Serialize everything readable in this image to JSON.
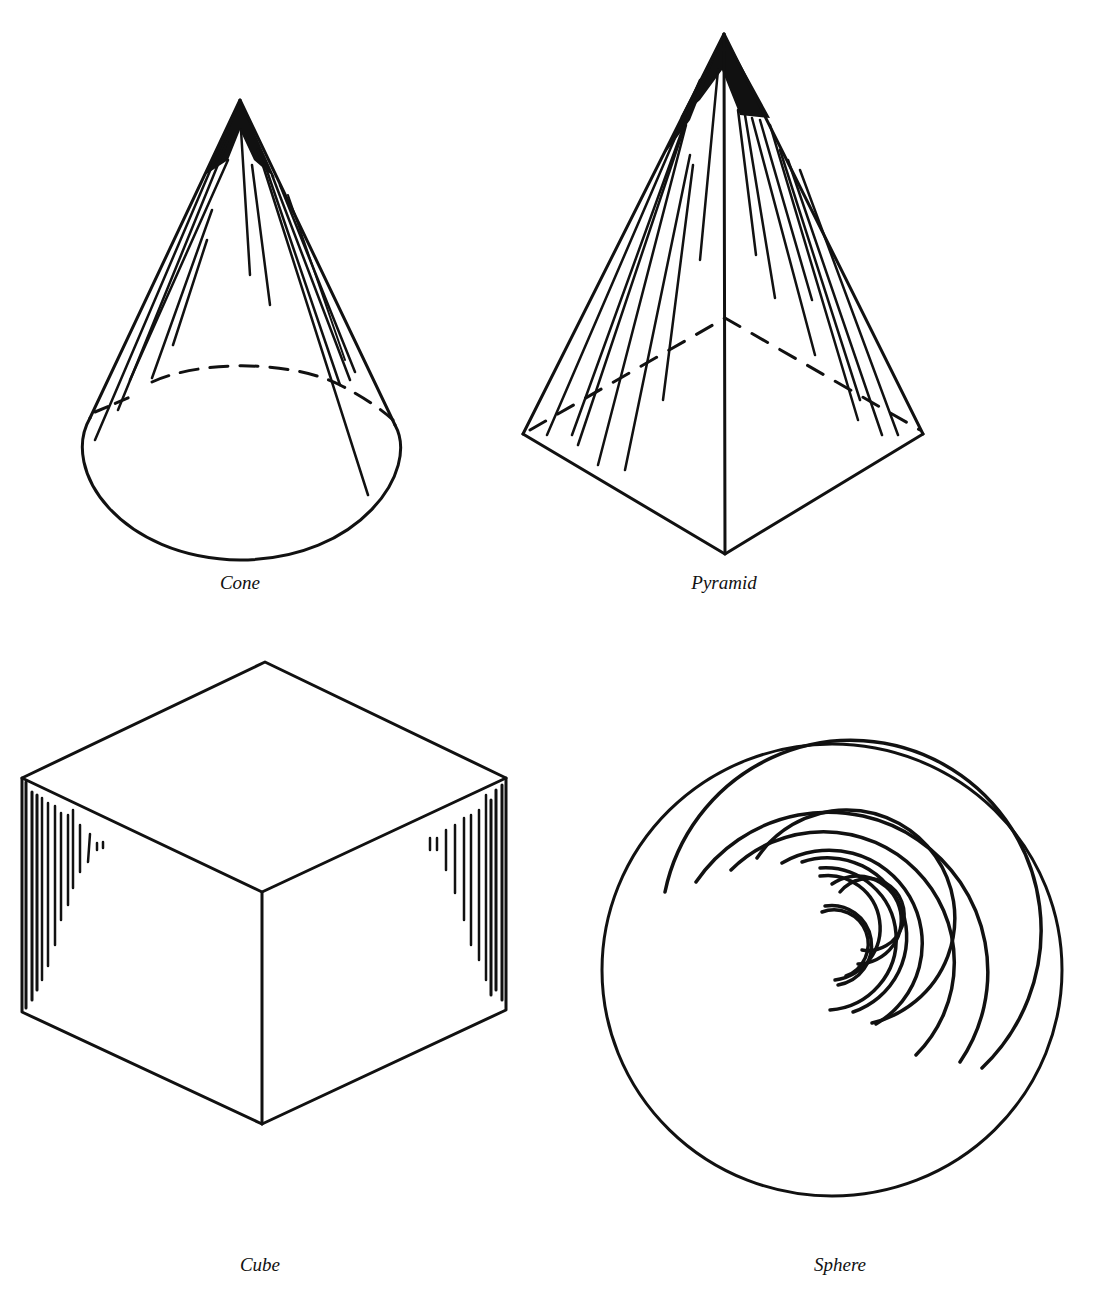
{
  "figure": {
    "stroke_color": "#111111",
    "background": "#ffffff"
  },
  "shapes": [
    {
      "id": "cone",
      "label": "Cone",
      "caption_x": 240,
      "caption_y": 570
    },
    {
      "id": "pyramid",
      "label": "Pyramid",
      "caption_x": 724,
      "caption_y": 571
    },
    {
      "id": "cube",
      "label": "Cube",
      "caption_x": 260,
      "caption_y": 1253
    },
    {
      "id": "sphere",
      "label": "Sphere",
      "caption_x": 840,
      "caption_y": 1253
    }
  ]
}
